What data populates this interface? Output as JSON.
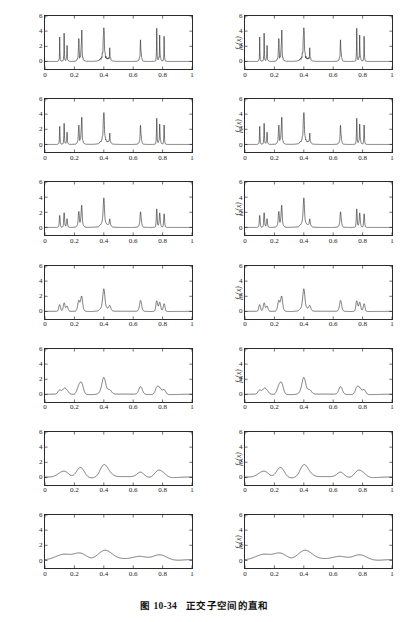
{
  "figure": {
    "caption_label": "图 10-34",
    "caption_title": "正交子空间的直和",
    "top_bleed_text": ""
  },
  "axis": {
    "x_ticks": [
      "0",
      "0.2",
      "0.4",
      "0.6",
      "0.8",
      "1"
    ],
    "x_tick_values": [
      0,
      0.2,
      0.4,
      0.6,
      0.8,
      1
    ],
    "y_ticks": [
      "0",
      "2",
      "4",
      "6"
    ],
    "y_tick_values": [
      0,
      2,
      4,
      6
    ],
    "xlim": [
      0,
      1
    ],
    "ylim": [
      -1,
      6
    ]
  },
  "chart_data": {
    "type": "line",
    "xlabel": "",
    "ylabel": "",
    "xlim": [
      0,
      1
    ],
    "ylim": [
      -1,
      6
    ],
    "grid": false,
    "legend": "none",
    "layout": {
      "rows": 7,
      "cols": 2
    },
    "xticks": [
      0,
      0.2,
      0.4,
      0.6,
      0.8,
      1
    ],
    "yticks": [
      0,
      2,
      4,
      6
    ],
    "panels": [
      {
        "row": 1,
        "col": 1,
        "ylabel": "f(x)",
        "series": "f"
      },
      {
        "row": 1,
        "col": 2,
        "ylabel": "f0(x)+g0(x)",
        "series": "f"
      },
      {
        "row": 2,
        "col": 1,
        "ylabel": "f0(x)",
        "series": "f0"
      },
      {
        "row": 2,
        "col": 2,
        "ylabel": "f1(x)+g1(x)",
        "series": "f0"
      },
      {
        "row": 3,
        "col": 1,
        "ylabel": "f1(x)",
        "series": "f1"
      },
      {
        "row": 3,
        "col": 2,
        "ylabel": "f2(x)+g2(x)",
        "series": "f1"
      },
      {
        "row": 4,
        "col": 1,
        "ylabel": "f2(x)",
        "series": "f2"
      },
      {
        "row": 4,
        "col": 2,
        "ylabel": "f3(x)+g3(x)",
        "series": "f2"
      },
      {
        "row": 5,
        "col": 1,
        "ylabel": "f3(x)",
        "series": "f3"
      },
      {
        "row": 5,
        "col": 2,
        "ylabel": "f4(x)+g4(x)",
        "series": "f3"
      },
      {
        "row": 6,
        "col": 1,
        "ylabel": "f4(x)",
        "series": "f4"
      },
      {
        "row": 6,
        "col": 2,
        "ylabel": "f5(x)+g5(x)",
        "series": "f4"
      },
      {
        "row": 7,
        "col": 1,
        "ylabel": "f5(x)",
        "series": "f5"
      },
      {
        "row": 7,
        "col": 2,
        "ylabel": "f6(x)+g6(x)",
        "series": "f5"
      }
    ],
    "bumps": [
      {
        "pos": 0.1,
        "height": 4.0,
        "width": 0.005
      },
      {
        "pos": 0.13,
        "height": 5.0,
        "width": 0.005
      },
      {
        "pos": 0.15,
        "height": 3.0,
        "width": 0.006
      },
      {
        "pos": 0.23,
        "height": 4.0,
        "width": 0.01
      },
      {
        "pos": 0.25,
        "height": 5.0,
        "width": 0.01
      },
      {
        "pos": 0.4,
        "height": 4.2,
        "width": 0.025
      },
      {
        "pos": 0.44,
        "height": 2.1,
        "width": 0.01
      },
      {
        "pos": 0.65,
        "height": 4.3,
        "width": 0.01
      },
      {
        "pos": 0.76,
        "height": 5.1,
        "width": 0.005
      },
      {
        "pos": 0.78,
        "height": 4.2,
        "width": 0.008
      },
      {
        "pos": 0.81,
        "height": 4.3,
        "width": 0.005
      }
    ],
    "series_labels": {
      "f": "original signal f(x) — full-resolution Bumps",
      "f0": "approximation at scale 0",
      "f1": "approximation at scale 1",
      "f2": "approximation at scale 2",
      "f3": "approximation at scale 3",
      "f4": "approximation at scale 4",
      "f5": "approximation at scale 5"
    }
  },
  "style": {
    "line_color": "#2b2b2b",
    "axis_color": "#2b2b2b",
    "background": "#ffffff",
    "tick_text_color": "#1d1d1d"
  }
}
